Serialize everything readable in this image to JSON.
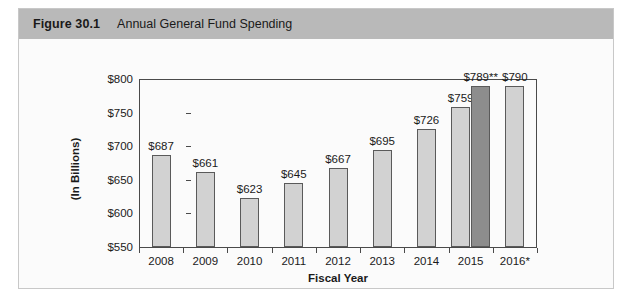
{
  "figure": {
    "number": "Figure 30.1",
    "title": "Annual General Fund Spending"
  },
  "colors": {
    "header_band": "#b9b9b9",
    "bar_light": "#d2d2d2",
    "bar_dark": "#8d8d8d",
    "axis": "#4a4a4a",
    "frame": "#c8c8c8"
  },
  "chart_data": {
    "type": "bar",
    "title": "Annual General Fund Spending",
    "xlabel": "Fiscal Year",
    "ylabel": "(In Billions)",
    "ylim": [
      550,
      800
    ],
    "yticks": [
      550,
      600,
      650,
      700,
      750,
      800
    ],
    "ytick_labels": [
      "$550",
      "$600",
      "$650",
      "$700",
      "$750",
      "$800"
    ],
    "grid": false,
    "legend": "none",
    "categories": [
      "2008",
      "2009",
      "2010",
      "2011",
      "2012",
      "2013",
      "2014",
      "2015",
      "2016*"
    ],
    "values": [
      687,
      661,
      623,
      645,
      667,
      695,
      726,
      759,
      790
    ],
    "data_labels": [
      "$687",
      "$661",
      "$623",
      "$645",
      "$667",
      "$695",
      "$726",
      "$759",
      "$790"
    ],
    "bars": [
      {
        "category": "2008",
        "value": 687,
        "label": "$687",
        "series": "enacted",
        "color": "#d2d2d2"
      },
      {
        "category": "2009",
        "value": 661,
        "label": "$661",
        "series": "enacted",
        "color": "#d2d2d2"
      },
      {
        "category": "2010",
        "value": 623,
        "label": "$623",
        "series": "enacted",
        "color": "#d2d2d2"
      },
      {
        "category": "2011",
        "value": 645,
        "label": "$645",
        "series": "enacted",
        "color": "#d2d2d2"
      },
      {
        "category": "2012",
        "value": 667,
        "label": "$667",
        "series": "enacted",
        "color": "#d2d2d2"
      },
      {
        "category": "2013",
        "value": 695,
        "label": "$695",
        "series": "enacted",
        "color": "#d2d2d2"
      },
      {
        "category": "2014",
        "value": 726,
        "label": "$726",
        "series": "enacted",
        "color": "#d2d2d2"
      },
      {
        "category": "2015",
        "value": 759,
        "label": "$759",
        "series": "enacted",
        "color": "#d2d2d2"
      },
      {
        "category": "2015",
        "value": 789,
        "label": "$789**",
        "series": "estimate",
        "color": "#8d8d8d"
      },
      {
        "category": "2016*",
        "value": 790,
        "label": "$790",
        "series": "enacted",
        "color": "#d2d2d2"
      }
    ],
    "annotations": [
      {
        "text": "2016*",
        "note": "asterisk on 2016 category label"
      },
      {
        "text": "$789**",
        "note": "double asterisk on 2015 second bar label"
      }
    ]
  }
}
